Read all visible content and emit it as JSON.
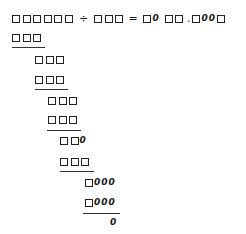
{
  "equation": {
    "dividend": "□□□□□□",
    "operator": "÷",
    "divisor": "□□□",
    "equals": "=",
    "quotient_part1": "□0",
    "quotient_part2": "□□.□00□",
    "quotient_decimal_point": "."
  },
  "working": [
    {
      "text": "□□□",
      "x": 12,
      "y": 33,
      "underline": true
    },
    {
      "text": "□□□",
      "x": 35,
      "y": 55,
      "underline": false
    },
    {
      "text": "□□□",
      "x": 35,
      "y": 75,
      "underline": true
    },
    {
      "text": "□□□",
      "x": 48,
      "y": 96,
      "underline": false
    },
    {
      "text": "□□□",
      "x": 48,
      "y": 115,
      "underline": true
    },
    {
      "text": "□□0",
      "x": 60,
      "y": 136,
      "underline": false
    },
    {
      "text": "□□□",
      "x": 60,
      "y": 157,
      "underline": true
    },
    {
      "text": "□000",
      "x": 85,
      "y": 178,
      "underline": false
    },
    {
      "text": "□000",
      "x": 85,
      "y": 198,
      "underline": true
    },
    {
      "text": "0",
      "x": 110,
      "y": 218,
      "underline": false
    }
  ],
  "final_remainder": "0"
}
